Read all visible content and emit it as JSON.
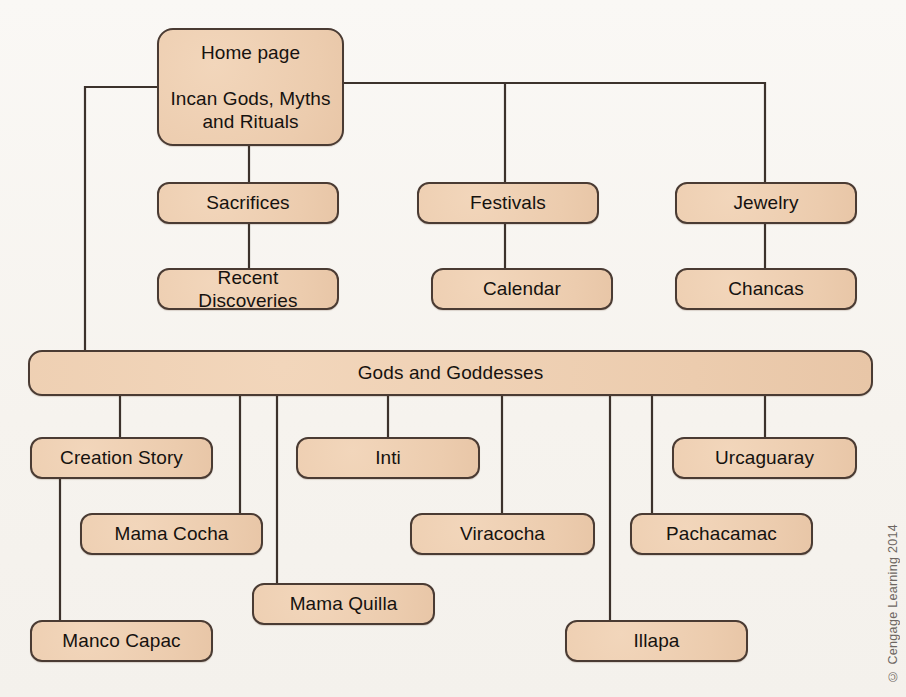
{
  "diagram": {
    "type": "site-map-flowchart",
    "colors": {
      "node_fill": "#efd0b3",
      "node_border": "#4a3b33",
      "edge": "#3c322c",
      "page_background": "#f7f4f0",
      "text": "#16120f"
    },
    "nodes": [
      {
        "id": "home",
        "label": "Home page\n\nIncan Gods, Myths\nand Rituals",
        "x": 157,
        "y": 28,
        "w": 187,
        "h": 118,
        "style": "home"
      },
      {
        "id": "sacrifices",
        "label": "Sacrifices",
        "x": 157,
        "y": 182,
        "w": 182,
        "h": 42,
        "style": "box"
      },
      {
        "id": "recent",
        "label": "Recent Discoveries",
        "x": 157,
        "y": 268,
        "w": 182,
        "h": 42,
        "style": "box"
      },
      {
        "id": "festivals",
        "label": "Festivals",
        "x": 417,
        "y": 182,
        "w": 182,
        "h": 42,
        "style": "box"
      },
      {
        "id": "calendar",
        "label": "Calendar",
        "x": 431,
        "y": 268,
        "w": 182,
        "h": 42,
        "style": "box"
      },
      {
        "id": "jewelry",
        "label": "Jewelry",
        "x": 675,
        "y": 182,
        "w": 182,
        "h": 42,
        "style": "box"
      },
      {
        "id": "chancas",
        "label": "Chancas",
        "x": 675,
        "y": 268,
        "w": 182,
        "h": 42,
        "style": "box"
      },
      {
        "id": "gods",
        "label": "Gods and Goddesses",
        "x": 28,
        "y": 350,
        "w": 845,
        "h": 46,
        "style": "wide"
      },
      {
        "id": "creation",
        "label": "Creation Story",
        "x": 30,
        "y": 437,
        "w": 183,
        "h": 42,
        "style": "box"
      },
      {
        "id": "mamacocha",
        "label": "Mama Cocha",
        "x": 80,
        "y": 513,
        "w": 183,
        "h": 42,
        "style": "box"
      },
      {
        "id": "mancocapac",
        "label": "Manco Capac",
        "x": 30,
        "y": 620,
        "w": 183,
        "h": 42,
        "style": "box"
      },
      {
        "id": "mamaquilla",
        "label": "Mama Quilla",
        "x": 252,
        "y": 583,
        "w": 183,
        "h": 42,
        "style": "box"
      },
      {
        "id": "inti",
        "label": "Inti",
        "x": 296,
        "y": 437,
        "w": 184,
        "h": 42,
        "style": "box"
      },
      {
        "id": "viracocha",
        "label": "Viracocha",
        "x": 410,
        "y": 513,
        "w": 185,
        "h": 42,
        "style": "box"
      },
      {
        "id": "illapa",
        "label": "Illapa",
        "x": 565,
        "y": 620,
        "w": 183,
        "h": 42,
        "style": "box"
      },
      {
        "id": "pachacamac",
        "label": "Pachacamac",
        "x": 630,
        "y": 513,
        "w": 183,
        "h": 42,
        "style": "box"
      },
      {
        "id": "urcaguaray",
        "label": "Urcaguaray",
        "x": 672,
        "y": 437,
        "w": 185,
        "h": 42,
        "style": "box"
      }
    ],
    "edges": [
      {
        "from": "home",
        "to": "sacrifices",
        "path": "M 249 146 L 249 182"
      },
      {
        "from": "sacrifices",
        "to": "recent",
        "path": "M 249 224 L 249 268"
      },
      {
        "from": "home",
        "to": "festivals",
        "path": "M 344 83 L 505 83 L 505 182"
      },
      {
        "from": "festivals",
        "to": "calendar",
        "path": "M 505 224 L 505 268"
      },
      {
        "from": "home",
        "to": "jewelry",
        "path": "M 505 83 L 765 83 L 765 182"
      },
      {
        "from": "jewelry",
        "to": "chancas",
        "path": "M 765 224 L 765 268"
      },
      {
        "from": "home",
        "to": "gods",
        "path": "M 157 87 L 85 87 L 85 350"
      },
      {
        "from": "gods",
        "to": "creation",
        "path": "M 120 396 L 120 437"
      },
      {
        "from": "creation",
        "to": "mancocapac",
        "path": "M 60 479 L 60 620"
      },
      {
        "from": "gods",
        "to": "mamacocha",
        "path": "M 240 396 L 240 513"
      },
      {
        "from": "gods",
        "to": "mamaquilla",
        "path": "M 277 396 L 277 583"
      },
      {
        "from": "gods",
        "to": "inti",
        "path": "M 388 396 L 388 437"
      },
      {
        "from": "gods",
        "to": "viracocha",
        "path": "M 502 396 L 502 513"
      },
      {
        "from": "gods",
        "to": "illapa",
        "path": "M 610 396 L 610 620"
      },
      {
        "from": "gods",
        "to": "pachacamac",
        "path": "M 652 396 L 652 513"
      },
      {
        "from": "gods",
        "to": "urcaguaray",
        "path": "M 765 396 L 765 437"
      }
    ]
  },
  "copyright": "© Cengage Learning 2014"
}
